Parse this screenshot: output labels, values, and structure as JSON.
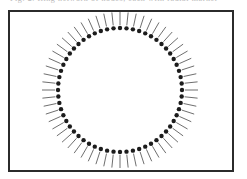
{
  "figure": {
    "caption_clipped": "Fig. 2.  Ring network of nodes, each with radial marker",
    "frame": {
      "border_color": "#2b2b2b",
      "background_color": "#ffffff",
      "x": 8,
      "y": 10,
      "width": 226,
      "height": 162
    },
    "diagram": {
      "type": "radial-dot-ring",
      "center_x": 120,
      "center_y": 90,
      "dot_radius": 62,
      "dot_size": 2.2,
      "dot_color": "#1c1c1c",
      "tick_color": "#5d5d5d",
      "tick_inner_offset": 3,
      "tick_length": 13,
      "tick_width": 0.9,
      "node_count": 60,
      "start_angle_deg": -90,
      "direction": "clockwise"
    }
  }
}
